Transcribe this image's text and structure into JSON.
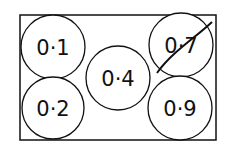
{
  "diagram": {
    "frame": {
      "x": 20,
      "y": 15,
      "w": 196,
      "h": 125
    },
    "circles": [
      {
        "label": "0·1",
        "cx": 53,
        "cy": 47,
        "r": 32,
        "crossed": false
      },
      {
        "label": "0·2",
        "cx": 53,
        "cy": 108,
        "r": 31,
        "crossed": false
      },
      {
        "label": "0·4",
        "cx": 118,
        "cy": 78,
        "r": 32,
        "crossed": false
      },
      {
        "label": "0·7",
        "cx": 181,
        "cy": 45,
        "r": 32,
        "crossed": true
      },
      {
        "label": "0·9",
        "cx": 180,
        "cy": 108,
        "r": 32,
        "crossed": false
      }
    ],
    "stroke_color": "#111111"
  }
}
